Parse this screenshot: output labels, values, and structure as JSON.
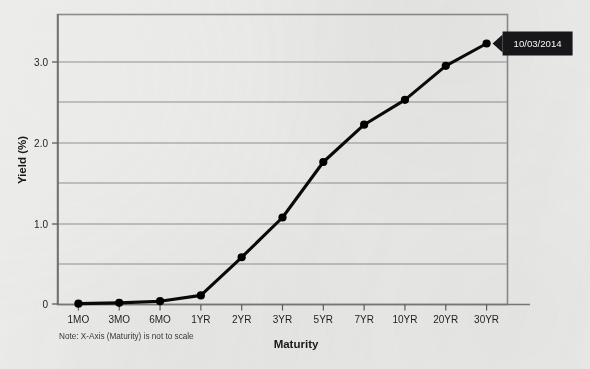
{
  "chart_data": {
    "type": "line",
    "title": "",
    "xlabel": "Maturity",
    "ylabel": "Yield (%)",
    "categories": [
      "1MO",
      "3MO",
      "6MO",
      "1YR",
      "2YR",
      "3YR",
      "5YR",
      "7YR",
      "10YR",
      "20YR",
      "30YR"
    ],
    "values": [
      0.01,
      0.02,
      0.04,
      0.11,
      0.57,
      1.05,
      1.72,
      2.17,
      2.47,
      2.88,
      3.15
    ],
    "series": [
      {
        "name": "10/03/2014",
        "values": [
          0.01,
          0.02,
          0.04,
          0.11,
          0.57,
          1.05,
          1.72,
          2.17,
          2.47,
          2.88,
          3.15
        ]
      }
    ],
    "ylim": [
      0,
      3.5
    ],
    "ytick_values": [
      0,
      0.5,
      1.0,
      1.5,
      2.0,
      2.5,
      3.0
    ],
    "ytick_labels": [
      "0",
      "",
      "1.0",
      "",
      "2.0",
      "",
      "3.0"
    ],
    "grid": true,
    "legend": "none",
    "annotations": [
      {
        "text": "10/03/2014",
        "attached_to": "30YR",
        "style": "black-callout-left-arrow"
      }
    ],
    "footnote": "Note: X-Axis (Maturity) is not to scale",
    "line_color": "#000000",
    "marker": "circle",
    "marker_color": "#000000",
    "grid_color": "#8a8a8a",
    "plot_background": "#ececea"
  },
  "axes": {
    "y_title": "Yield (%)",
    "x_title": "Maturity",
    "y_labels": [
      "3.0",
      "2.0",
      "1.0",
      "0"
    ],
    "x_labels": [
      "1MO",
      "3MO",
      "6MO",
      "1YR",
      "2YR",
      "3YR",
      "5YR",
      "7YR",
      "10YR",
      "20YR",
      "30YR"
    ]
  },
  "callout": {
    "label": "10/03/2014",
    "background": "#17171a",
    "text_color": "#ffffff"
  },
  "note": {
    "text": "Note: X-Axis (Maturity) is not to scale"
  }
}
